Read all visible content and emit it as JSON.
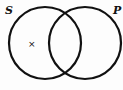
{
  "diagram": {
    "type": "venn",
    "sets": [
      {
        "label": "S",
        "cx": 45,
        "cy": 43,
        "r": 36
      },
      {
        "label": "P",
        "cx": 85,
        "cy": 43,
        "r": 36
      }
    ],
    "marks": [
      {
        "symbol": "×",
        "region": "S only",
        "x": 31,
        "y": 46
      }
    ],
    "stroke_color": "#111111",
    "background": "#fdfdfd"
  }
}
